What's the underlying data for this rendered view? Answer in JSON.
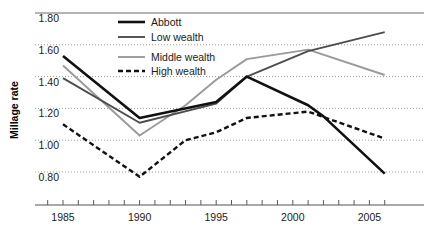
{
  "chart_data": {
    "type": "line",
    "title": "",
    "xlabel": "",
    "ylabel": "Millage rate",
    "xlim": [
      1983.6,
      1906.4
    ],
    "ylim": [
      0.7,
      1.8
    ],
    "grid": true,
    "legend_position": "top-center",
    "y_ticks": [
      "1.80",
      "1.60",
      "1.40",
      "1.20",
      "1.00",
      "0.80"
    ],
    "y_tick_values": [
      1.8,
      1.6,
      1.4,
      1.2,
      1.0,
      0.8
    ],
    "x_ticks": [
      "1985",
      "1990",
      "1995",
      "2000",
      "2005"
    ],
    "x_tick_values": [
      1985,
      1990,
      1995,
      2000,
      2005
    ],
    "x_minor_ticks": [
      1984,
      1985,
      1986,
      1987,
      1988,
      1989,
      1990,
      1991,
      1992,
      1993,
      1994,
      1995,
      1996,
      1997,
      1998,
      1999,
      2000,
      2001,
      2002,
      2003,
      2004,
      2005,
      2006
    ],
    "x": [
      1985,
      1990,
      1995,
      1997,
      2001,
      2006
    ],
    "series": [
      {
        "name": "Abbott",
        "color": "#111111",
        "width": 2.6,
        "dash": "none",
        "x": [
          1985,
          1990,
          1995,
          1997,
          2001,
          2002,
          2006
        ],
        "values": [
          1.53,
          1.14,
          1.24,
          1.4,
          1.22,
          1.15,
          0.79
        ]
      },
      {
        "name": "Low wealth",
        "color": "#4d4d4d",
        "width": 1.9,
        "dash": "none",
        "x": [
          1985,
          1990,
          1995,
          1997,
          2001,
          2006
        ],
        "values": [
          1.39,
          1.11,
          1.23,
          1.4,
          1.56,
          1.68
        ]
      },
      {
        "name": "Middle wealth",
        "color": "#9a9a9a",
        "width": 1.9,
        "dash": "none",
        "x": [
          1985,
          1990,
          1993,
          1995,
          1997,
          2001,
          2006
        ],
        "values": [
          1.47,
          1.03,
          1.22,
          1.38,
          1.51,
          1.57,
          1.41
        ]
      },
      {
        "name": "High wealth",
        "color": "#111111",
        "width": 2.4,
        "dash": "5,3",
        "x": [
          1985,
          1990,
          1993,
          1995,
          1997,
          2000,
          2001,
          2006
        ],
        "values": [
          1.1,
          0.77,
          1.0,
          1.05,
          1.14,
          1.17,
          1.18,
          1.01
        ]
      }
    ]
  },
  "legend": {
    "items": [
      {
        "label": "Abbott"
      },
      {
        "label": "Low wealth"
      },
      {
        "label": "Middle wealth"
      },
      {
        "label": "High wealth"
      }
    ]
  },
  "colors": {
    "abbott": "#111111",
    "low_wealth": "#4d4d4d",
    "middle_wealth": "#9a9a9a",
    "high_wealth": "#111111",
    "gridline": "#9b9b9b",
    "axis": "#8d8d8d",
    "background": "#ffffff"
  }
}
